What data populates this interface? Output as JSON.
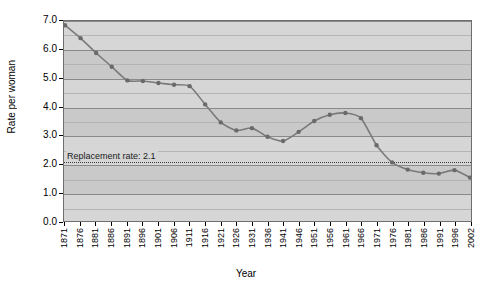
{
  "chart_data": {
    "type": "line",
    "title": "",
    "xlabel": "Year",
    "ylabel": "Rate per woman",
    "ylim": [
      0.0,
      7.0
    ],
    "xlim": [
      1871,
      2002
    ],
    "grid": true,
    "legend": null,
    "y_ticks": [
      "0.0",
      "1.0",
      "2.0",
      "3.0",
      "4.0",
      "5.0",
      "6.0",
      "7.0"
    ],
    "y_minor_step": 0.5,
    "categories": [
      1871,
      1876,
      1881,
      1886,
      1891,
      1896,
      1901,
      1906,
      1911,
      1916,
      1921,
      1926,
      1931,
      1936,
      1941,
      1946,
      1951,
      1956,
      1961,
      1966,
      1971,
      1976,
      1981,
      1986,
      1991,
      1996,
      2002
    ],
    "tick_labels": [
      "1871",
      "1876",
      "1881",
      "1886",
      "1891",
      "1896",
      "1901",
      "1906",
      "1911",
      "1916",
      "1921",
      "1926",
      "1931",
      "1936",
      "1941",
      "1946",
      "1951",
      "1956",
      "1961",
      "1966",
      "1971",
      "1976",
      "1981",
      "1986",
      "1991",
      "1996",
      "2002"
    ],
    "series": [
      {
        "name": "Total fertility rate",
        "color": "#7a7a7a",
        "values": [
          6.85,
          6.4,
          5.88,
          5.4,
          4.92,
          4.9,
          4.83,
          4.77,
          4.72,
          4.08,
          3.45,
          3.17,
          3.25,
          2.95,
          2.8,
          3.12,
          3.5,
          3.72,
          3.78,
          3.6,
          2.65,
          2.05,
          1.8,
          1.69,
          1.66,
          1.78,
          1.52
        ]
      }
    ],
    "annotations": [
      {
        "name": "replacement-rate",
        "text": "Replacement rate: 2.1",
        "value": 2.1,
        "style": "dotted-horizontal-line",
        "color": "#3a3a3a"
      }
    ]
  },
  "figure": {
    "background": "#ffffff",
    "plot_background": "#c9c9c9",
    "band_color": "#d6d6d6",
    "gridline_color": "#8a8a8a",
    "border_color": "#6e6e6e",
    "line_color": "#7a7a7a",
    "marker_color": "#6a6a6a"
  }
}
